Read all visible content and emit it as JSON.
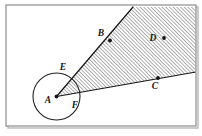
{
  "figure": {
    "background_color": "#ffffff",
    "ink_color": "#151515",
    "frame": {
      "name": "outer-frame",
      "x": 6,
      "y": 5,
      "width": 190,
      "height": 121,
      "stroke_color": "#8c8c8c",
      "stroke_width": 1.2,
      "shadow_color": "#b8b8b8"
    },
    "circle": {
      "name": "circle-at-A",
      "cx": 56.5,
      "cy": 96.5,
      "r": 23.5,
      "stroke_color": "#222222",
      "stroke_width": 1.1,
      "fill": "none"
    },
    "shaded_region": {
      "name": "hatched-wedge",
      "hatch_angle_deg": 45,
      "hatch_spacing_px": 2.6,
      "hatch_color": "#2b2b2b",
      "hatch_width": 0.75,
      "polygon": "56.5,96.5 133,7 196,7 196,72"
    },
    "rays": [
      {
        "name": "ray-A-to-B",
        "from": "A",
        "through": "B",
        "x1": 56.5,
        "y1": 96.5,
        "x2": 133,
        "y2": 7,
        "stroke_color": "#151515",
        "stroke_width": 1.2
      },
      {
        "name": "ray-A-to-C",
        "from": "A",
        "through": "C",
        "x1": 56.5,
        "y1": 96.5,
        "x2": 196,
        "y2": 72,
        "stroke_color": "#151515",
        "stroke_width": 1.2
      }
    ],
    "points": [
      {
        "id": "A",
        "label": "A",
        "name": "point-A",
        "x": 56.5,
        "y": 96.5,
        "dot": true,
        "dot_r": 1.9,
        "label_x": 48,
        "label_y": 103,
        "role": "vertex"
      },
      {
        "id": "B",
        "label": "B",
        "name": "point-B",
        "x": 110,
        "y": 40.5,
        "dot": true,
        "dot_r": 1.9,
        "label_x": 101,
        "label_y": 36,
        "role": "on-upper-ray"
      },
      {
        "id": "C",
        "label": "C",
        "name": "point-C",
        "x": 158,
        "y": 78,
        "dot": true,
        "dot_r": 1.9,
        "label_x": 155,
        "label_y": 89,
        "role": "on-lower-ray"
      },
      {
        "id": "D",
        "label": "D",
        "name": "point-D",
        "x": 164,
        "y": 38,
        "dot": true,
        "dot_r": 1.9,
        "label_x": 153,
        "label_y": 41,
        "role": "interior-of-wedge"
      },
      {
        "id": "E",
        "label": "E",
        "name": "point-E",
        "x": 70,
        "y": 73,
        "dot": false,
        "dot_r": 0,
        "label_x": 63,
        "label_y": 70,
        "role": "circle-meets-upper-ray"
      },
      {
        "id": "F",
        "label": "F",
        "name": "point-F",
        "x": 79,
        "y": 100,
        "dot": false,
        "dot_r": 0,
        "label_x": 75,
        "label_y": 108,
        "role": "circle-meets-lower-ray"
      }
    ]
  }
}
